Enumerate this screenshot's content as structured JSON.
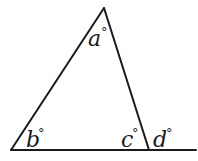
{
  "diagram": {
    "type": "triangle-with-exterior-angle",
    "stroke_color": "#1a1a1a",
    "vertices": {
      "apex": [
        104,
        8
      ],
      "bottom_left": [
        11,
        150
      ],
      "bottom_right": [
        149,
        150
      ]
    },
    "baseline_extension_end": [
      196,
      150
    ],
    "angles": [
      {
        "id": "a",
        "letter": "a",
        "unit": "°",
        "position": "interior-apex"
      },
      {
        "id": "b",
        "letter": "b",
        "unit": "°",
        "position": "interior-bottom-left"
      },
      {
        "id": "c",
        "letter": "c",
        "unit": "°",
        "position": "interior-bottom-right"
      },
      {
        "id": "d",
        "letter": "d",
        "unit": "°",
        "position": "exterior-bottom-right"
      }
    ]
  }
}
